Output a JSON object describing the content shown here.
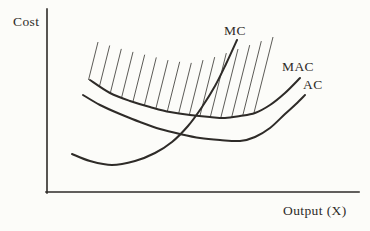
{
  "figure": {
    "colors": {
      "paper": "#fcfcf9",
      "ink": "#2e2b28",
      "hatch": "#4a4844"
    },
    "axes": {
      "y_axis_label": "Cost",
      "x_axis_label": "Output (X)",
      "origin": [
        47,
        192
      ],
      "y_top": 9,
      "x_right": 359,
      "stroke_width": 1.6
    },
    "labels": {
      "cost": {
        "text": "Cost",
        "x": 13,
        "y": 26
      },
      "mc": {
        "text": "MC",
        "x": 224,
        "y": 35
      },
      "mac": {
        "text": "MAC",
        "x": 282,
        "y": 71
      },
      "ac": {
        "text": "AC",
        "x": 303,
        "y": 89
      },
      "output": {
        "text": "Output (X)",
        "x": 283,
        "y": 215
      }
    },
    "curves": [
      {
        "id": "mc",
        "name": "Marginal cost",
        "stroke_width": 2,
        "points": [
          [
            72,
            154
          ],
          [
            90,
            161
          ],
          [
            112,
            165
          ],
          [
            135,
            161
          ],
          [
            155,
            153
          ],
          [
            172,
            142
          ],
          [
            188,
            126
          ],
          [
            202,
            107
          ],
          [
            215,
            86
          ],
          [
            226,
            64
          ],
          [
            237,
            40
          ]
        ]
      },
      {
        "id": "mac",
        "name": "Marginal abatement / average cost upper curve",
        "stroke_width": 2,
        "points": [
          [
            90,
            80
          ],
          [
            110,
            93
          ],
          [
            130,
            101
          ],
          [
            150,
            107
          ],
          [
            170,
            112
          ],
          [
            190,
            115
          ],
          [
            210,
            117
          ],
          [
            225,
            118
          ],
          [
            240,
            116
          ],
          [
            255,
            113
          ],
          [
            270,
            105
          ],
          [
            285,
            93
          ],
          [
            300,
            78
          ]
        ]
      },
      {
        "id": "ac",
        "name": "Average cost lower curve",
        "stroke_width": 2,
        "points": [
          [
            83,
            95
          ],
          [
            100,
            105
          ],
          [
            120,
            114
          ],
          [
            140,
            122
          ],
          [
            160,
            129
          ],
          [
            180,
            134
          ],
          [
            200,
            138
          ],
          [
            220,
            140
          ],
          [
            240,
            141
          ],
          [
            255,
            137
          ],
          [
            270,
            128
          ],
          [
            285,
            114
          ],
          [
            296,
            104
          ],
          [
            305,
            95
          ]
        ]
      }
    ],
    "hatch": {
      "count": 16,
      "x_start": 98,
      "x_end": 273,
      "slant": 0.25,
      "stroke_width": 0.9,
      "top_envelope": [
        [
          98,
          42
        ],
        [
          125,
          50
        ],
        [
          150,
          56
        ],
        [
          172,
          61
        ],
        [
          192,
          63
        ],
        [
          215,
          57
        ],
        [
          238,
          49
        ],
        [
          256,
          43
        ],
        [
          273,
          37
        ]
      ],
      "bottom_curve": "mac"
    }
  }
}
